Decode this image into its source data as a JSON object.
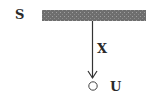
{
  "diagram": {
    "type": "pendulum-ceiling-sketch",
    "labels": {
      "support": "S",
      "string": "X",
      "object": "U"
    },
    "elements": {
      "ceiling_bar": {
        "x": 42,
        "y": 10,
        "width": 104,
        "height": 11,
        "fill": "#6e6e6e",
        "pattern_dot": "#a0a0a0"
      },
      "string_line": {
        "x": 92.5,
        "y1": 21,
        "y2": 78,
        "stroke": "#333333"
      },
      "arrow_head": {
        "tip_x": 92.5,
        "tip_y": 78
      },
      "object_circle": {
        "cx": 93,
        "cy": 86,
        "r": 4.2,
        "stroke": "#444444"
      }
    }
  }
}
